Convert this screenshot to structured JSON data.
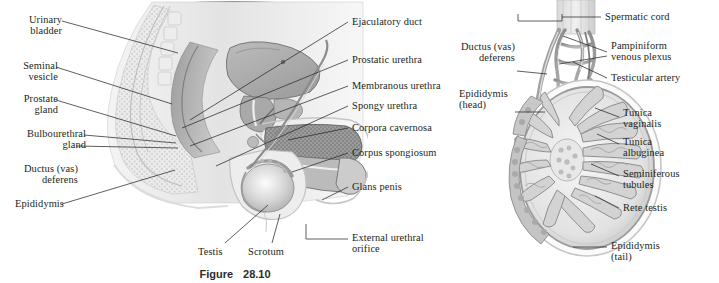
{
  "figure": {
    "caption_label": "Figure",
    "caption_number": "28.10",
    "background_color": "#ffffff",
    "line_color": "#2a2a2a",
    "text_color": "#231f20"
  },
  "panel_a": {
    "name": "sagittal-section-male-reproductive-system",
    "labels_left": [
      {
        "id": "urinary-bladder",
        "text": "Urinary\nbladder"
      },
      {
        "id": "seminal-vesicle",
        "text": "Seminal\nvesicle"
      },
      {
        "id": "prostate-gland",
        "text": "Prostate\ngland"
      },
      {
        "id": "bulbourethral-gland",
        "text": "Bulbourethral\ngland"
      },
      {
        "id": "ductus-vas-deferens",
        "text": "Ductus (vas)\ndeferens"
      },
      {
        "id": "epididymis",
        "text": "Epididymis"
      }
    ],
    "labels_right": [
      {
        "id": "ejaculatory-duct",
        "text": "Ejaculatory duct"
      },
      {
        "id": "prostatic-urethra",
        "text": "Prostatic urethra"
      },
      {
        "id": "membranous-urethra",
        "text": "Membranous urethra"
      },
      {
        "id": "spongy-urethra",
        "text": "Spongy urethra"
      },
      {
        "id": "corpora-cavernosa",
        "text": "Corpora cavernosa"
      },
      {
        "id": "corpus-spongiosum",
        "text": "Corpus spongiosum"
      },
      {
        "id": "glans-penis",
        "text": "Glans penis"
      },
      {
        "id": "external-urethral-orifice",
        "text": "External urethral\norifice"
      }
    ],
    "labels_bottom": [
      {
        "id": "testis",
        "text": "Testis"
      },
      {
        "id": "scrotum",
        "text": "Scrotum"
      }
    ]
  },
  "panel_b": {
    "name": "testis-epididymis-section",
    "labels_left": [
      {
        "id": "ductus-vas-deferens-b",
        "text": "Ductus (vas)\ndeferens"
      },
      {
        "id": "epididymis-head",
        "text": "Epididymis\n(head)"
      }
    ],
    "labels_right": [
      {
        "id": "spermatic-cord",
        "text": "Spermatic cord"
      },
      {
        "id": "pampiniform-venous-plexus",
        "text": "Pampiniform\nvenous plexus"
      },
      {
        "id": "testicular-artery",
        "text": "Testicular artery"
      },
      {
        "id": "tunica-vaginalis",
        "text": "Tunica\nvaginalis"
      },
      {
        "id": "tunica-albuginea",
        "text": "Tunica\nalbuginea"
      },
      {
        "id": "seminiferous-tubules",
        "text": "Seminiferous\ntubules"
      },
      {
        "id": "rete-testis",
        "text": "Rete testis"
      },
      {
        "id": "epididymis-tail",
        "text": "Epididymis\n(tail)"
      }
    ]
  }
}
